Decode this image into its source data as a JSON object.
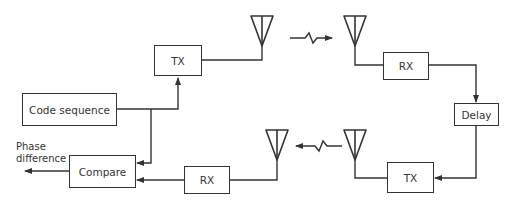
{
  "diagram": {
    "blocks": {
      "tx_local": "TX",
      "code_sequence": "Code sequence",
      "compare": "Compare",
      "rx_local": "RX",
      "rx_remote": "RX",
      "delay": "Delay",
      "tx_remote": "TX"
    },
    "output_label": {
      "line1": "Phase",
      "line2": "difference"
    },
    "antennas": [
      "tx-local-antenna",
      "rx-remote-antenna",
      "tx-remote-antenna",
      "rx-local-antenna"
    ],
    "links": [
      {
        "from": "code_sequence",
        "to": "tx_local"
      },
      {
        "from": "code_sequence",
        "to": "compare"
      },
      {
        "from": "tx_local",
        "to": "antenna_1"
      },
      {
        "from": "antenna_1",
        "to": "antenna_2",
        "type": "wireless"
      },
      {
        "from": "antenna_2",
        "to": "rx_remote"
      },
      {
        "from": "rx_remote",
        "to": "delay"
      },
      {
        "from": "delay",
        "to": "tx_remote"
      },
      {
        "from": "tx_remote",
        "to": "antenna_3"
      },
      {
        "from": "antenna_3",
        "to": "antenna_4",
        "type": "wireless"
      },
      {
        "from": "antenna_4",
        "to": "rx_local"
      },
      {
        "from": "rx_local",
        "to": "compare"
      },
      {
        "from": "compare",
        "to": "output"
      }
    ],
    "colors": {
      "line": "#333333",
      "background": "#ffffff"
    }
  }
}
